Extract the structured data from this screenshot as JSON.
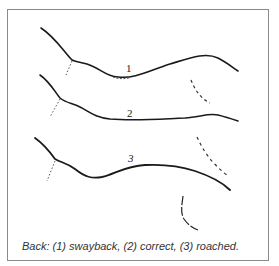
{
  "figure": {
    "labels": [
      "1",
      "2",
      "3"
    ],
    "caption": "Back: (1) swayback, (2) correct, (3) roached."
  },
  "colors": {
    "line": "#1a1a1a",
    "border": "#8a8a8a",
    "caption": "#333333"
  }
}
